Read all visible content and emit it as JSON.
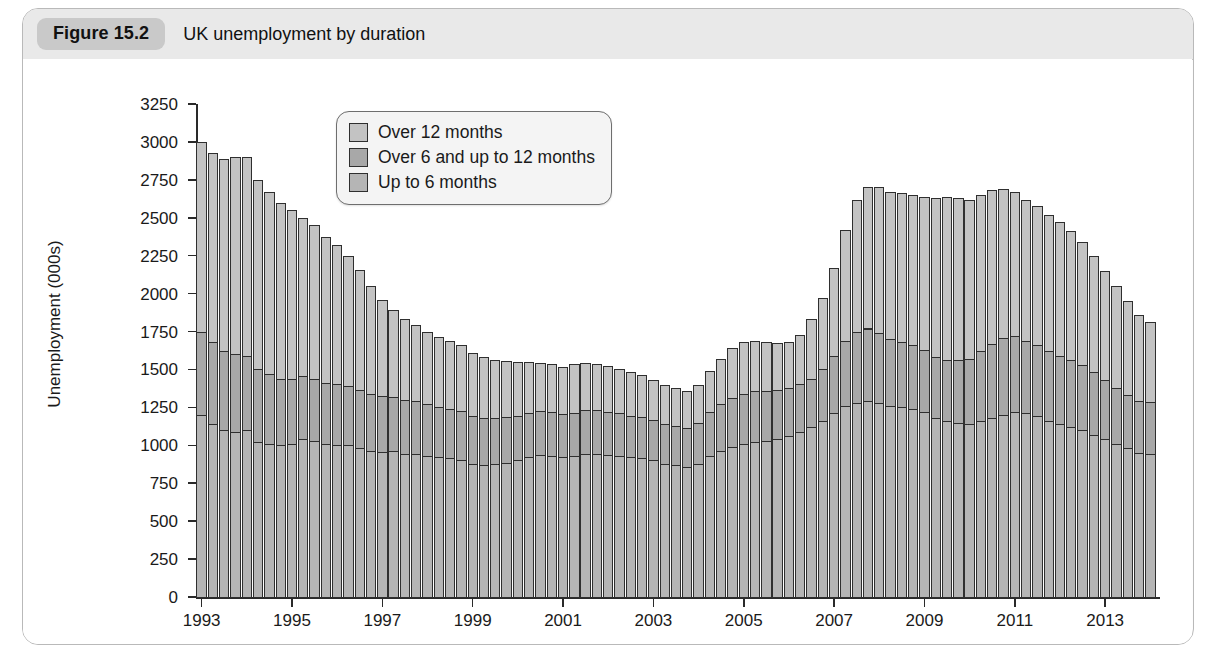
{
  "figure": {
    "number": "Figure 15.2",
    "caption": "UK unemployment by duration"
  },
  "legend": {
    "position": "top-center-right",
    "items": [
      {
        "label": "Over 12 months",
        "color": "#c3c3c3",
        "key": "over12"
      },
      {
        "label": "Over 6 and up to 12 months",
        "color": "#a8a8a8",
        "key": "over6to12"
      },
      {
        "label": "Up to 6 months",
        "color": "#b5b5b5",
        "key": "upto6"
      }
    ]
  },
  "chart_data": {
    "type": "bar",
    "stacked": true,
    "title": "UK unemployment by duration",
    "xlabel": "",
    "ylabel": "Unemployment (000s)",
    "ylim": [
      0,
      3250
    ],
    "ytick_step": 250,
    "yticks": [
      0,
      250,
      500,
      750,
      1000,
      1250,
      1500,
      1750,
      2000,
      2250,
      2500,
      2750,
      3000,
      3250
    ],
    "ytick_labels": [
      "0",
      "250",
      "500",
      "750",
      "1000",
      "1250",
      "1500",
      "1750",
      "2000",
      "2250",
      "2500",
      "2750",
      "3000",
      "3250"
    ],
    "xticks": [
      1993,
      1995,
      1997,
      1999,
      2001,
      2003,
      2005,
      2007,
      2009,
      2011,
      2013
    ],
    "xtick_labels": [
      "1993",
      "1995",
      "1997",
      "1999",
      "2001",
      "2003",
      "2005",
      "2007",
      "2009",
      "2011",
      "2013"
    ],
    "x_start_year": 1993,
    "x_end_year": 2014,
    "frequency": "quarterly",
    "grid": false,
    "legend_position": "upper center",
    "series": [
      {
        "name": "Up to 6 months",
        "key": "upto6",
        "color": "#b5b5b5",
        "values": [
          1200,
          1140,
          1100,
          1090,
          1100,
          1020,
          1010,
          1000,
          1010,
          1040,
          1030,
          1010,
          1005,
          1000,
          980,
          960,
          955,
          960,
          945,
          940,
          930,
          920,
          915,
          905,
          880,
          870,
          875,
          885,
          900,
          920,
          935,
          930,
          920,
          930,
          945,
          940,
          935,
          930,
          920,
          915,
          900,
          880,
          870,
          860,
          880,
          930,
          960,
          990,
          1010,
          1020,
          1030,
          1040,
          1060,
          1090,
          1120,
          1160,
          1210,
          1260,
          1280,
          1290,
          1280,
          1260,
          1250,
          1240,
          1220,
          1180,
          1160,
          1150,
          1140,
          1160,
          1180,
          1200,
          1220,
          1210,
          1190,
          1160,
          1140,
          1120,
          1100,
          1070,
          1040,
          1010,
          980,
          950,
          940
        ]
      },
      {
        "name": "Over 6 and up to 12 months",
        "key": "over6to12",
        "color": "#a8a8a8",
        "values": [
          550,
          540,
          520,
          510,
          490,
          480,
          460,
          440,
          430,
          420,
          410,
          400,
          400,
          390,
          385,
          380,
          370,
          360,
          355,
          350,
          340,
          330,
          325,
          320,
          315,
          310,
          305,
          300,
          295,
          290,
          290,
          290,
          285,
          285,
          290,
          290,
          285,
          280,
          275,
          270,
          265,
          260,
          255,
          255,
          270,
          290,
          310,
          320,
          330,
          335,
          330,
          325,
          320,
          315,
          320,
          340,
          380,
          430,
          470,
          480,
          460,
          440,
          430,
          420,
          410,
          400,
          400,
          410,
          430,
          460,
          490,
          510,
          500,
          480,
          470,
          460,
          450,
          440,
          430,
          410,
          390,
          370,
          350,
          340,
          345
        ]
      },
      {
        "name": "Over 12 months",
        "key": "over12",
        "color": "#c3c3c3",
        "values": [
          1250,
          1250,
          1270,
          1300,
          1310,
          1250,
          1200,
          1160,
          1110,
          1040,
          1010,
          960,
          915,
          860,
          790,
          710,
          630,
          570,
          530,
          500,
          480,
          465,
          450,
          435,
          415,
          400,
          385,
          370,
          355,
          340,
          320,
          315,
          310,
          320,
          310,
          305,
          300,
          295,
          290,
          280,
          265,
          255,
          250,
          245,
          250,
          270,
          300,
          330,
          340,
          330,
          320,
          310,
          300,
          320,
          390,
          470,
          580,
          730,
          870,
          930,
          960,
          970,
          980,
          990,
          1010,
          1050,
          1080,
          1070,
          1050,
          1030,
          1010,
          980,
          950,
          930,
          920,
          900,
          880,
          850,
          810,
          770,
          720,
          670,
          620,
          570,
          530
        ]
      }
    ],
    "notes": {
      "peak_total_approx": 2600,
      "peak_period": "2011 Q4",
      "start_total_approx": 3000,
      "trough_total_approx": 1400,
      "trough_period": "2005"
    }
  }
}
